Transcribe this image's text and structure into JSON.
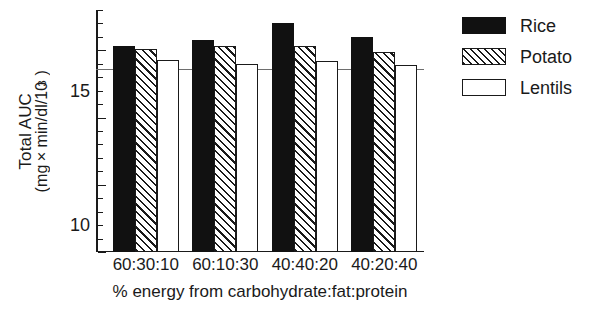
{
  "chart_data": {
    "type": "bar",
    "title": "",
    "subtitle": "",
    "xlabel": "% energy from carbohydrate:fat:protein",
    "ylabel_line1": "Total AUC",
    "ylabel_line2_prefix": "(mg",
    "ylabel_line2_mult": "×",
    "ylabel_line2_mid": "min/dl/10",
    "ylabel_line2_sup": "3",
    "ylabel_line2_suffix": ")",
    "ylabel_full": "Total AUC (mg × min/dl/10^3)",
    "categories": [
      "60:30:10",
      "60:10:30",
      "40:40:20",
      "40:20:40"
    ],
    "series": [
      {
        "name": "Rice",
        "values": [
          15.3,
          15.8,
          17.0,
          16.0
        ]
      },
      {
        "name": "Potato",
        "values": [
          15.1,
          15.3,
          15.3,
          14.9
        ]
      },
      {
        "name": "Lentils",
        "values": [
          14.3,
          14.0,
          14.2,
          13.9
        ]
      }
    ],
    "ylim": [
      0,
      18
    ],
    "ytick_labels": [
      "0",
      "5",
      "10",
      "15"
    ],
    "ytick_values": [
      0,
      5,
      10,
      15
    ],
    "yminor_step": 1,
    "grid": false,
    "legend_position": "right",
    "reference_line": {
      "value": 13.6,
      "label": ""
    },
    "annotations": []
  },
  "legend": {
    "entries": [
      {
        "label": "Rice",
        "fill": "solid-black",
        "color": "#111111"
      },
      {
        "label": "Potato",
        "fill": "diagonal-hatch",
        "color": "#1a1a1a"
      },
      {
        "label": "Lentils",
        "fill": "empty-white",
        "color": "#ffffff"
      }
    ]
  },
  "colors": {
    "axis": "#1a1a1a",
    "reference_line": "#6e6e6e",
    "background": "#ffffff"
  }
}
